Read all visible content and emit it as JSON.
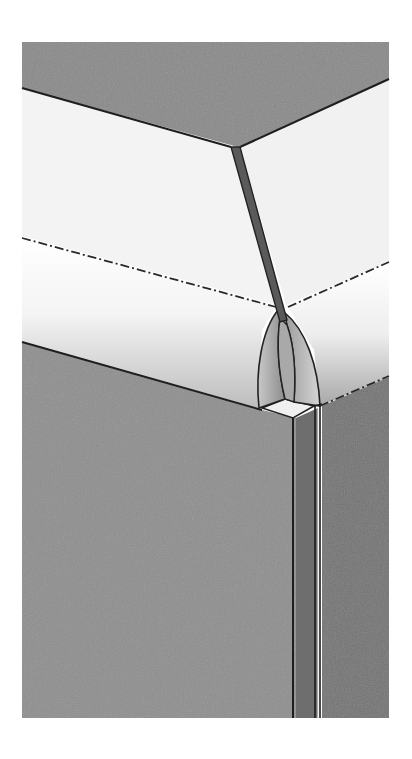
{
  "figure": {
    "colors": {
      "background": "#ffffff",
      "back_surface": "#8a8a8a",
      "top_surface": "#f2f2f2",
      "front_face_left": "#8f8f8f",
      "front_face_right": "#6f6f6f",
      "seam": "#555555",
      "outline": "#222222"
    },
    "labels": []
  }
}
